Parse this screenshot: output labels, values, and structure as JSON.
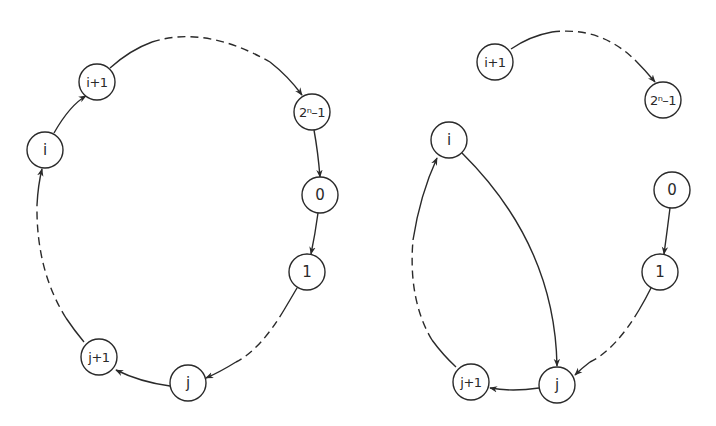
{
  "diagram": {
    "left_panel": {
      "nodes": [
        {
          "id": "L_i",
          "label": "i"
        },
        {
          "id": "L_i1",
          "label": "i+1"
        },
        {
          "id": "L_top",
          "label": "2ⁿ–1"
        },
        {
          "id": "L_0",
          "label": "0"
        },
        {
          "id": "L_1",
          "label": "1"
        },
        {
          "id": "L_j",
          "label": "j"
        },
        {
          "id": "L_j1",
          "label": "j+1"
        }
      ],
      "edges": [
        {
          "from": "i",
          "to": "i+1",
          "style": "solid"
        },
        {
          "from": "i+1",
          "to": "2ⁿ–1",
          "style": "dashed"
        },
        {
          "from": "2ⁿ–1",
          "to": "0",
          "style": "solid"
        },
        {
          "from": "0",
          "to": "1",
          "style": "solid"
        },
        {
          "from": "1",
          "to": "j",
          "style": "dashed"
        },
        {
          "from": "j",
          "to": "j+1",
          "style": "solid"
        },
        {
          "from": "j+1",
          "to": "i",
          "style": "dashed"
        }
      ]
    },
    "right_panel": {
      "nodes": [
        {
          "id": "R_i1",
          "label": "i+1"
        },
        {
          "id": "R_top",
          "label": "2ⁿ–1"
        },
        {
          "id": "R_i",
          "label": "i"
        },
        {
          "id": "R_0",
          "label": "0"
        },
        {
          "id": "R_1",
          "label": "1"
        },
        {
          "id": "R_j",
          "label": "j"
        },
        {
          "id": "R_j1",
          "label": "j+1"
        }
      ],
      "edges": [
        {
          "from": "i+1",
          "to": "2ⁿ–1",
          "style": "dashed"
        },
        {
          "from": "i",
          "to": "j",
          "style": "solid"
        },
        {
          "from": "0",
          "to": "1",
          "style": "solid"
        },
        {
          "from": "1",
          "to": "j",
          "style": "dashed"
        },
        {
          "from": "j",
          "to": "j+1",
          "style": "solid"
        },
        {
          "from": "j+1",
          "to": "i",
          "style": "dashed"
        }
      ]
    }
  }
}
